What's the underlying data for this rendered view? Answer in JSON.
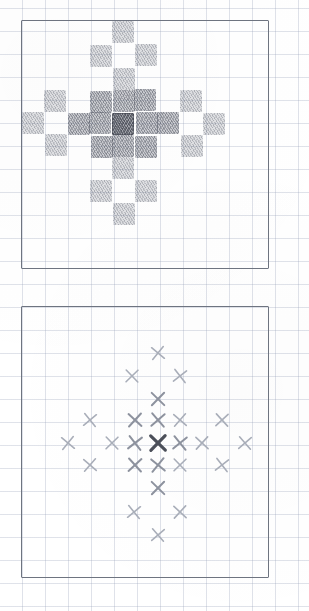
{
  "figure": {
    "title": "",
    "medium": "pencil-on-graph-paper",
    "grid_spacing_px": 23,
    "colors": {
      "grid_line": "#96a0b9",
      "panel_border": "#6e7480",
      "shade_light": "#787d8a",
      "shade_medium": "#686d7a",
      "shade_dark": "#4e535f",
      "mark_faint": "#a9aeb9",
      "mark_medium": "#8d929e",
      "mark_dark": "#4b4f59",
      "paper": "#ffffff"
    }
  },
  "panels": [
    {
      "id": "top-panel",
      "name": "shaded-grid-panel",
      "label": "",
      "frame": {
        "x": 21,
        "y": 20,
        "w": 248,
        "h": 249
      },
      "cols": 11,
      "rows": 11,
      "cell_px": 22.6,
      "origin": {
        "x": 1,
        "y": 2
      },
      "note": "diamond / cross kernel rendered as shaded graph-paper cells",
      "cells": [
        {
          "col": 5,
          "row": 1,
          "level": 1
        },
        {
          "col": 4,
          "row": 2,
          "level": 1
        },
        {
          "col": 6,
          "row": 2,
          "level": 1
        },
        {
          "col": 5,
          "row": 3,
          "level": 1
        },
        {
          "col": 2,
          "row": 4,
          "level": 1
        },
        {
          "col": 4,
          "row": 4,
          "level": 2
        },
        {
          "col": 5,
          "row": 4,
          "level": 2
        },
        {
          "col": 6,
          "row": 4,
          "level": 2
        },
        {
          "col": 8,
          "row": 4,
          "level": 1
        },
        {
          "col": 1,
          "row": 5,
          "level": 1
        },
        {
          "col": 3,
          "row": 5,
          "level": 2
        },
        {
          "col": 4,
          "row": 5,
          "level": 2
        },
        {
          "col": 5,
          "row": 5,
          "level": 3
        },
        {
          "col": 6,
          "row": 5,
          "level": 2
        },
        {
          "col": 7,
          "row": 5,
          "level": 2
        },
        {
          "col": 9,
          "row": 5,
          "level": 1
        },
        {
          "col": 2,
          "row": 6,
          "level": 1
        },
        {
          "col": 4,
          "row": 6,
          "level": 2
        },
        {
          "col": 5,
          "row": 6,
          "level": 2
        },
        {
          "col": 6,
          "row": 6,
          "level": 2
        },
        {
          "col": 8,
          "row": 6,
          "level": 1
        },
        {
          "col": 5,
          "row": 7,
          "level": 1
        },
        {
          "col": 4,
          "row": 8,
          "level": 1
        },
        {
          "col": 6,
          "row": 8,
          "level": 1
        },
        {
          "col": 5,
          "row": 9,
          "level": 1
        }
      ]
    },
    {
      "id": "bottom-panel",
      "name": "x-mark-scatter-panel",
      "label": "",
      "frame": {
        "x": 21,
        "y": 306,
        "w": 248,
        "h": 272
      },
      "cols": 11,
      "rows": 12,
      "cell_px": 22.6,
      "note": "same kernel drawn as pencil X marks, weight encodes magnitude",
      "marks": [
        {
          "cx": 158,
          "cy": 353,
          "weight": "faint"
        },
        {
          "cx": 132,
          "cy": 376,
          "weight": "faint"
        },
        {
          "cx": 180,
          "cy": 376,
          "weight": "faint"
        },
        {
          "cx": 158,
          "cy": 399,
          "weight": "mid"
        },
        {
          "cx": 90,
          "cy": 420,
          "weight": "faint"
        },
        {
          "cx": 135,
          "cy": 420,
          "weight": "mid"
        },
        {
          "cx": 158,
          "cy": 420,
          "weight": "mid"
        },
        {
          "cx": 180,
          "cy": 420,
          "weight": "faint"
        },
        {
          "cx": 222,
          "cy": 420,
          "weight": "faint"
        },
        {
          "cx": 68,
          "cy": 443,
          "weight": "faint"
        },
        {
          "cx": 112,
          "cy": 443,
          "weight": "faint"
        },
        {
          "cx": 135,
          "cy": 443,
          "weight": "mid"
        },
        {
          "cx": 158,
          "cy": 443,
          "weight": "dark"
        },
        {
          "cx": 180,
          "cy": 443,
          "weight": "mid"
        },
        {
          "cx": 202,
          "cy": 443,
          "weight": "faint"
        },
        {
          "cx": 245,
          "cy": 443,
          "weight": "faint"
        },
        {
          "cx": 90,
          "cy": 465,
          "weight": "faint"
        },
        {
          "cx": 135,
          "cy": 465,
          "weight": "mid"
        },
        {
          "cx": 158,
          "cy": 465,
          "weight": "mid"
        },
        {
          "cx": 180,
          "cy": 465,
          "weight": "faint"
        },
        {
          "cx": 222,
          "cy": 465,
          "weight": "faint"
        },
        {
          "cx": 158,
          "cy": 488,
          "weight": "mid"
        },
        {
          "cx": 134,
          "cy": 512,
          "weight": "faint"
        },
        {
          "cx": 180,
          "cy": 512,
          "weight": "faint"
        },
        {
          "cx": 158,
          "cy": 535,
          "weight": "faint"
        }
      ]
    }
  ]
}
